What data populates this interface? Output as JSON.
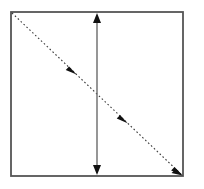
{
  "figure": {
    "title": "",
    "background_color": "#ffffff",
    "width": 204,
    "height": 189
  },
  "shapes": {
    "boundary_rect": {
      "label": "square boundary",
      "x": 11,
      "y": 12,
      "width": 172,
      "height": 164,
      "stroke_color": "#555555",
      "stroke_width": 1.8,
      "fill": "none"
    },
    "diagonal_arrow": {
      "label": "dashed diagonal arrow",
      "x1": 12,
      "y1": 13,
      "x2": 182,
      "y2": 175,
      "stroke_color": "#3a3a3a",
      "stroke_width": 1.1,
      "dash_pattern": "1.6 2.4",
      "direction": "top-left to bottom-right",
      "arrowhead_count": 4,
      "arrowhead_positions": [
        0.1,
        0.38,
        0.68,
        1.0
      ],
      "arrowhead_color": "#111111"
    },
    "vertical_arrow": {
      "label": "vertical double-headed arrow",
      "x": 97,
      "y1": 13,
      "y2": 175,
      "stroke_color": "#6a6a6a",
      "stroke_width": 1.4,
      "arrowhead_color": "#111111",
      "double_headed": true
    }
  }
}
